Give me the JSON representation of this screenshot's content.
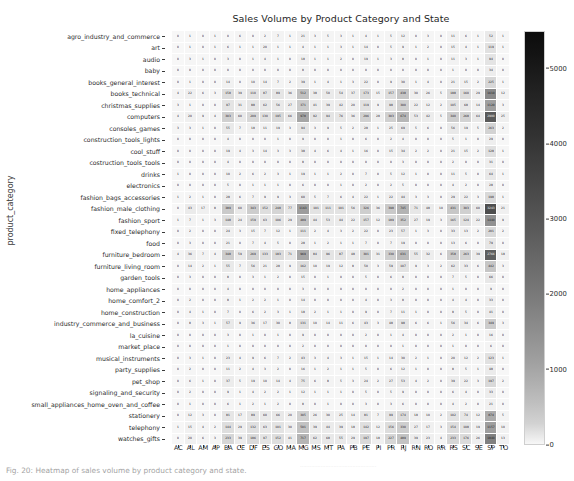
{
  "figure": {
    "title": "Sales Volume by Product Category and State",
    "ylabel": "product_category",
    "xlabel": ""
  },
  "colorbar": {
    "ticks": [
      "0",
      "1000",
      "2000",
      "3000",
      "4000",
      "5000"
    ],
    "tickvalues": [
      0,
      1000,
      2000,
      3000,
      4000,
      5000
    ],
    "vmin": 0,
    "vmax": 5500,
    "cmap": "Greys",
    "low_color": "#f2f2f2",
    "high_color": "#1a1a1a"
  },
  "caption": {
    "text": "Fig. 20: Heatmap of sales volume by product category and state.",
    "strip": "................................................"
  },
  "chart_data": {
    "type": "heatmap",
    "title": "Sales Volume by Product Category and State",
    "xlabel": "",
    "ylabel": "product_category",
    "cmap": "Greys",
    "annot": true,
    "vmin": 0,
    "vmax": 5500,
    "colorbar_ticks": [
      0,
      1000,
      2000,
      3000,
      4000,
      5000
    ],
    "xticklabels": [
      "AC",
      "AL",
      "AM",
      "AP",
      "BA",
      "CE",
      "DF",
      "ES",
      "GO",
      "MA",
      "MG",
      "MS",
      "MT",
      "PA",
      "PB",
      "PE",
      "PI",
      "PR",
      "RJ",
      "RN",
      "RO",
      "RR",
      "RS",
      "SC",
      "SE",
      "SP",
      "TO"
    ],
    "yticklabels": [
      "agro_industry_and_commerce",
      "art",
      "audio",
      "baby",
      "books_general_interest",
      "books_technical",
      "christmas_supplies",
      "computers",
      "consoles_games",
      "construction_tools_lights",
      "cool_stuff",
      "costruction_tools_tools",
      "drinks",
      "electronics",
      "fashion_bags_accessories",
      "fashion_male_clothing",
      "fashion_sport",
      "fixed_telephony",
      "food",
      "furniture_bedroom",
      "furniture_living_room",
      "garden_tools",
      "home_appliances",
      "home_comfort_2",
      "home_construction",
      "industry_commerce_and_business",
      "la_cuisine",
      "market_place",
      "musical_instruments",
      "party_supplies",
      "pet_shop",
      "signaling_and_security",
      "small_appliances_home_oven_and_coffee",
      "stationery",
      "telephony",
      "watches_gifts"
    ],
    "values": [
      [
        0,
        1,
        0,
        1,
        0,
        6,
        0,
        2,
        7,
        1,
        21,
        3,
        5,
        3,
        1,
        4,
        1,
        5,
        12,
        0,
        3,
        0,
        11,
        6,
        1,
        52,
        1
      ],
      [
        0,
        1,
        0,
        1,
        6,
        1,
        1,
        20,
        1,
        1,
        4,
        1,
        1,
        3,
        1,
        14,
        0,
        5,
        9,
        1,
        2,
        0,
        15,
        4,
        1,
        119,
        1
      ],
      [
        0,
        3,
        1,
        0,
        3,
        0,
        1,
        4,
        1,
        0,
        18,
        1,
        1,
        2,
        0,
        19,
        1,
        3,
        8,
        0,
        1,
        0,
        11,
        3,
        1,
        94,
        0
      ],
      [
        0,
        0,
        0,
        0,
        0,
        0,
        0,
        0,
        0,
        0,
        8,
        0,
        0,
        0,
        0,
        0,
        0,
        0,
        0,
        0,
        0,
        0,
        1,
        0,
        0,
        34,
        0
      ],
      [
        0,
        1,
        0,
        0,
        14,
        0,
        10,
        14,
        7,
        2,
        39,
        1,
        4,
        1,
        3,
        22,
        0,
        9,
        30,
        1,
        4,
        0,
        21,
        15,
        2,
        225,
        1
      ],
      [
        4,
        22,
        6,
        3,
        158,
        39,
        110,
        87,
        89,
        36,
        512,
        38,
        50,
        54,
        37,
        173,
        15,
        157,
        438,
        30,
        26,
        5,
        188,
        160,
        29,
        1610,
        12
      ],
      [
        3,
        1,
        0,
        0,
        97,
        31,
        88,
        62,
        56,
        27,
        371,
        41,
        39,
        42,
        20,
        119,
        9,
        98,
        300,
        22,
        12,
        2,
        105,
        68,
        14,
        1120,
        3
      ],
      [
        4,
        20,
        9,
        4,
        303,
        60,
        209,
        130,
        195,
        66,
        978,
        92,
        94,
        76,
        36,
        296,
        28,
        303,
        674,
        53,
        42,
        5,
        340,
        268,
        64,
        2900,
        25
      ],
      [
        3,
        3,
        1,
        0,
        55,
        7,
        18,
        11,
        19,
        3,
        94,
        3,
        9,
        5,
        2,
        28,
        1,
        25,
        69,
        5,
        6,
        0,
        56,
        19,
        5,
        263,
        2
      ],
      [
        0,
        0,
        0,
        0,
        4,
        0,
        0,
        0,
        1,
        0,
        9,
        0,
        0,
        1,
        0,
        6,
        0,
        2,
        4,
        0,
        0,
        0,
        5,
        1,
        0,
        29,
        0
      ],
      [
        0,
        0,
        0,
        0,
        19,
        4,
        3,
        14,
        3,
        3,
        38,
        4,
        6,
        4,
        1,
        16,
        0,
        15,
        34,
        2,
        2,
        0,
        21,
        15,
        2,
        128,
        1
      ],
      [
        0,
        0,
        0,
        0,
        4,
        0,
        0,
        0,
        0,
        0,
        8,
        0,
        0,
        0,
        0,
        0,
        0,
        0,
        3,
        0,
        0,
        0,
        2,
        0,
        0,
        31,
        0
      ],
      [
        1,
        0,
        0,
        0,
        10,
        2,
        6,
        2,
        3,
        1,
        19,
        1,
        1,
        2,
        0,
        7,
        0,
        5,
        12,
        1,
        0,
        0,
        11,
        5,
        0,
        64,
        1
      ],
      [
        0,
        0,
        0,
        0,
        5,
        0,
        1,
        1,
        1,
        0,
        6,
        0,
        0,
        1,
        0,
        2,
        0,
        2,
        5,
        0,
        0,
        0,
        4,
        2,
        0,
        28,
        0
      ],
      [
        1,
        2,
        1,
        0,
        28,
        6,
        7,
        9,
        9,
        3,
        60,
        5,
        7,
        6,
        4,
        22,
        1,
        22,
        44,
        3,
        3,
        0,
        29,
        22,
        3,
        198,
        1
      ],
      [
        0,
        43,
        17,
        8,
        389,
        60,
        343,
        152,
        248,
        77,
        1163,
        101,
        111,
        101,
        56,
        326,
        36,
        398,
        745,
        71,
        48,
        10,
        431,
        303,
        60,
        3243,
        21
      ],
      [
        1,
        7,
        1,
        3,
        148,
        24,
        159,
        63,
        106,
        29,
        489,
        44,
        53,
        44,
        22,
        157,
        12,
        189,
        352,
        27,
        19,
        3,
        165,
        124,
        22,
        1440,
        9
      ],
      [
        0,
        2,
        0,
        0,
        24,
        3,
        15,
        7,
        12,
        1,
        111,
        2,
        4,
        3,
        2,
        22,
        0,
        23,
        57,
        1,
        3,
        0,
        33,
        13,
        2,
        201,
        2
      ],
      [
        0,
        3,
        0,
        0,
        21,
        0,
        7,
        4,
        5,
        0,
        28,
        1,
        2,
        1,
        1,
        7,
        0,
        7,
        19,
        0,
        0,
        0,
        13,
        6,
        0,
        79,
        0
      ],
      [
        4,
        36,
        7,
        4,
        348,
        59,
        269,
        133,
        183,
        71,
        969,
        84,
        96,
        87,
        48,
        301,
        31,
        330,
        631,
        55,
        32,
        6,
        358,
        263,
        39,
        2766,
        18
      ],
      [
        0,
        14,
        2,
        1,
        55,
        7,
        56,
        21,
        28,
        9,
        162,
        10,
        19,
        12,
        8,
        50,
        3,
        59,
        107,
        9,
        3,
        2,
        62,
        33,
        6,
        442,
        3
      ],
      [
        0,
        3,
        0,
        0,
        8,
        0,
        3,
        1,
        2,
        0,
        15,
        0,
        1,
        0,
        0,
        5,
        0,
        6,
        8,
        0,
        0,
        0,
        7,
        5,
        0,
        66,
        0
      ],
      [
        0,
        0,
        0,
        0,
        4,
        0,
        0,
        0,
        0,
        0,
        3,
        0,
        0,
        0,
        0,
        0,
        0,
        0,
        2,
        0,
        0,
        0,
        1,
        0,
        0,
        9,
        0
      ],
      [
        0,
        2,
        0,
        0,
        8,
        1,
        2,
        2,
        1,
        0,
        14,
        0,
        0,
        0,
        0,
        4,
        0,
        3,
        8,
        0,
        0,
        0,
        4,
        4,
        0,
        33,
        0
      ],
      [
        0,
        4,
        1,
        0,
        7,
        0,
        6,
        2,
        3,
        1,
        18,
        2,
        1,
        1,
        0,
        9,
        0,
        7,
        11,
        1,
        0,
        0,
        8,
        5,
        0,
        41,
        0
      ],
      [
        0,
        8,
        3,
        1,
        57,
        9,
        36,
        17,
        30,
        8,
        131,
        10,
        14,
        11,
        6,
        43,
        3,
        48,
        98,
        6,
        6,
        1,
        56,
        34,
        6,
        349,
        3
      ],
      [
        0,
        0,
        0,
        0,
        3,
        0,
        1,
        0,
        1,
        0,
        9,
        0,
        0,
        0,
        0,
        2,
        0,
        1,
        4,
        0,
        0,
        0,
        2,
        1,
        0,
        16,
        0
      ],
      [
        0,
        0,
        0,
        0,
        1,
        0,
        0,
        0,
        0,
        0,
        2,
        0,
        0,
        0,
        0,
        0,
        0,
        0,
        1,
        0,
        0,
        0,
        1,
        0,
        0,
        6,
        0
      ],
      [
        0,
        3,
        1,
        0,
        23,
        4,
        9,
        6,
        7,
        2,
        43,
        3,
        4,
        3,
        1,
        15,
        1,
        14,
        30,
        2,
        1,
        0,
        20,
        12,
        2,
        123,
        1
      ],
      [
        0,
        2,
        0,
        0,
        11,
        2,
        4,
        3,
        2,
        0,
        16,
        1,
        2,
        1,
        1,
        5,
        0,
        6,
        12,
        1,
        0,
        0,
        8,
        5,
        1,
        48,
        0
      ],
      [
        0,
        6,
        1,
        0,
        37,
        5,
        19,
        10,
        14,
        4,
        75,
        6,
        8,
        5,
        3,
        24,
        2,
        27,
        53,
        4,
        2,
        0,
        39,
        22,
        3,
        197,
        2
      ],
      [
        0,
        2,
        0,
        0,
        9,
        1,
        4,
        2,
        2,
        1,
        12,
        1,
        1,
        1,
        0,
        5,
        0,
        5,
        9,
        0,
        0,
        0,
        6,
        4,
        0,
        33,
        0
      ],
      [
        0,
        1,
        0,
        0,
        6,
        1,
        2,
        1,
        2,
        0,
        8,
        0,
        1,
        0,
        0,
        3,
        0,
        3,
        6,
        0,
        0,
        0,
        4,
        2,
        0,
        21,
        0
      ],
      [
        0,
        12,
        3,
        0,
        81,
        17,
        89,
        60,
        66,
        20,
        305,
        26,
        30,
        25,
        14,
        81,
        7,
        99,
        174,
        18,
        10,
        2,
        102,
        74,
        12,
        874,
        5
      ],
      [
        1,
        15,
        4,
        2,
        144,
        29,
        132,
        63,
        101,
        30,
        501,
        39,
        44,
        39,
        18,
        142,
        12,
        156,
        330,
        27,
        17,
        3,
        154,
        108,
        19,
        1157,
        10
      ],
      [
        0,
        20,
        6,
        3,
        233,
        39,
        186,
        97,
        152,
        41,
        717,
        62,
        68,
        55,
        29,
        197,
        18,
        227,
        489,
        39,
        23,
        4,
        233,
        176,
        26,
        1840,
        13
      ]
    ]
  }
}
